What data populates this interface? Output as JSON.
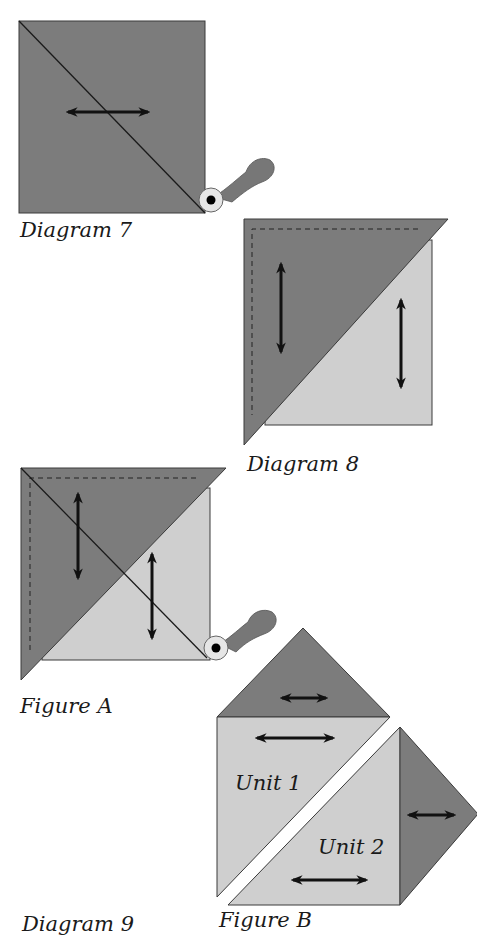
{
  "colors": {
    "dark_fabric": "#7c7c7c",
    "light_fabric": "#cfcfcf",
    "outline": "#3a3a3a",
    "arrow": "#111111",
    "cutter_handle": "#777777",
    "cutter_blade": "#e6e6e6",
    "background": "#ffffff"
  },
  "labels": {
    "diagram7": "Diagram 7",
    "diagram8": "Diagram 8",
    "figureA": "Figure A",
    "unit1": "Unit 1",
    "unit2": "Unit 2",
    "diagram9": "Diagram 9",
    "figureB": "Figure B"
  },
  "icons": {
    "rotary_cutter": "rotary-cutter-icon",
    "grain_arrow": "double-headed-arrow-icon",
    "seam_line": "dashed-seam-line"
  }
}
